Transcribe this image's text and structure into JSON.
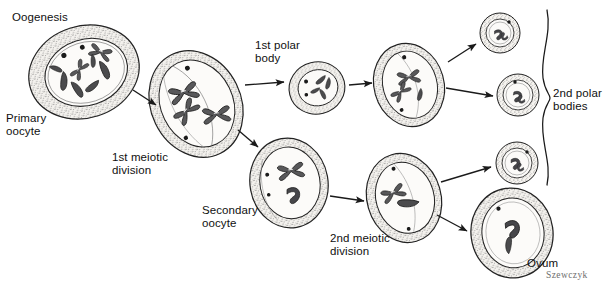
{
  "figure": {
    "title": "Oogenesis",
    "signature": "Szewczyk",
    "background_color": "#ffffff",
    "ink_color": "#1a1a1a",
    "chromatin_color": "#4a4a4a",
    "cytoplasm_color": "#f2f0ec"
  },
  "labels": [
    {
      "id": "title",
      "text": "Oogenesis",
      "x": 12,
      "y": 12
    },
    {
      "id": "primary-oocyte",
      "text": "Primary\noocyte",
      "x": 6,
      "y": 113
    },
    {
      "id": "first-meiotic",
      "text": "1st meiotic\ndivision",
      "x": 113,
      "y": 152
    },
    {
      "id": "first-polar-body",
      "text": "1st polar\nbody",
      "x": 256,
      "y": 40
    },
    {
      "id": "secondary-oocyte",
      "text": "Secondary\noocyte",
      "x": 203,
      "y": 205
    },
    {
      "id": "second-meiotic",
      "text": "2nd meiotic\ndivision",
      "x": 331,
      "y": 233
    },
    {
      "id": "second-polar",
      "text": "2nd polar\nbodies",
      "x": 554,
      "y": 88
    },
    {
      "id": "ovum",
      "text": "Ovum",
      "x": 528,
      "y": 258
    }
  ],
  "cells": [
    {
      "id": "primary-oocyte-cell",
      "name": "primary-oocyte-cell",
      "stage": "Primary oocyte",
      "cx": 84,
      "cy": 72,
      "rx": 56,
      "ry": 46,
      "rot": -18,
      "nucleus_rx": 41,
      "nucleus_ry": 32,
      "chromosome_count": 8,
      "nucleoli": 2
    },
    {
      "id": "first-meiotic-cell",
      "name": "first-meiotic-division-cell",
      "stage": "1st meiotic division",
      "cx": 196,
      "cy": 104,
      "rx": 44,
      "ry": 54,
      "rot": -26,
      "nucleus_rx": 35,
      "nucleus_ry": 44,
      "chromosome_count": 3,
      "nucleoli": 2
    },
    {
      "id": "first-polar-body-cell",
      "name": "first-polar-body-cell",
      "stage": "1st polar body",
      "cx": 317,
      "cy": 88,
      "rx": 28,
      "ry": 26,
      "rot": -14,
      "nucleus_rx": 20,
      "nucleus_ry": 18,
      "chromosome_count": 4,
      "nucleoli": 2
    },
    {
      "id": "post-polar-cell",
      "name": "post-first-polar-division-cell",
      "stage": "1st polar body dividing",
      "cx": 409,
      "cy": 85,
      "rx": 35,
      "ry": 42,
      "rot": -16,
      "nucleus_rx": 27,
      "nucleus_ry": 33,
      "chromosome_count": 3,
      "nucleoli": 2
    },
    {
      "id": "second-polar-body-upper",
      "name": "second-polar-body-upper",
      "stage": "2nd polar body",
      "cx": 500,
      "cy": 33,
      "rx": 20,
      "ry": 19,
      "rot": 0,
      "nucleus_rx": 14,
      "nucleus_ry": 13,
      "chromosome_count": 2,
      "nucleoli": 1
    },
    {
      "id": "second-polar-body-lower",
      "name": "second-polar-body-lower",
      "stage": "2nd polar body",
      "cx": 518,
      "cy": 95,
      "rx": 21,
      "ry": 20,
      "rot": 0,
      "nucleus_rx": 15,
      "nucleus_ry": 14,
      "chromosome_count": 2,
      "nucleoli": 1
    },
    {
      "id": "secondary-oocyte-cell",
      "name": "secondary-oocyte-cell",
      "stage": "Secondary oocyte",
      "cx": 289,
      "cy": 183,
      "rx": 39,
      "ry": 44,
      "rot": -10,
      "nucleus_rx": 30,
      "nucleus_ry": 35,
      "chromosome_count": 2,
      "nucleoli": 2
    },
    {
      "id": "second-meiotic-cell",
      "name": "second-meiotic-division-cell",
      "stage": "2nd meiotic division",
      "cx": 404,
      "cy": 198,
      "rx": 37,
      "ry": 44,
      "rot": -16,
      "nucleus_rx": 29,
      "nucleus_ry": 35,
      "chromosome_count": 2,
      "nucleoli": 2
    },
    {
      "id": "second-polar-body-right",
      "name": "second-polar-body-right",
      "stage": "2nd polar body",
      "cx": 517,
      "cy": 163,
      "rx": 21,
      "ry": 21,
      "rot": 0,
      "nucleus_rx": 15,
      "nucleus_ry": 15,
      "chromosome_count": 2,
      "nucleoli": 1
    },
    {
      "id": "ovum-cell",
      "name": "ovum-cell",
      "stage": "Ovum",
      "cx": 512,
      "cy": 233,
      "rx": 41,
      "ry": 45,
      "rot": -8,
      "nucleus_rx": 31,
      "nucleus_ry": 35,
      "chromosome_count": 2,
      "nucleoli": 1
    }
  ],
  "arrows": [
    {
      "id": "a1",
      "from": "primary-oocyte-cell",
      "to": "first-meiotic-cell",
      "x1": 133,
      "y1": 90,
      "x2": 158,
      "y2": 106
    },
    {
      "id": "a2",
      "from": "first-meiotic-cell",
      "to": "first-polar-body-cell",
      "x1": 245,
      "y1": 85,
      "x2": 286,
      "y2": 82
    },
    {
      "id": "a3",
      "from": "first-meiotic-cell",
      "to": "secondary-oocyte-cell",
      "x1": 238,
      "y1": 130,
      "x2": 260,
      "y2": 148
    },
    {
      "id": "a4",
      "from": "first-polar-body-cell",
      "to": "post-polar-cell",
      "x1": 349,
      "y1": 85,
      "x2": 374,
      "y2": 82
    },
    {
      "id": "a5",
      "from": "post-polar-cell",
      "to": "second-polar-body-upper",
      "x1": 448,
      "y1": 62,
      "x2": 477,
      "y2": 44
    },
    {
      "id": "a6",
      "from": "post-polar-cell",
      "to": "second-polar-body-lower",
      "x1": 446,
      "y1": 88,
      "x2": 494,
      "y2": 96
    },
    {
      "id": "a7",
      "from": "secondary-oocyte-cell",
      "to": "second-meiotic-cell",
      "x1": 330,
      "y1": 196,
      "x2": 366,
      "y2": 201
    },
    {
      "id": "a8",
      "from": "second-meiotic-cell",
      "to": "second-polar-body-right",
      "x1": 441,
      "y1": 182,
      "x2": 492,
      "y2": 166
    },
    {
      "id": "a9",
      "from": "second-meiotic-cell",
      "to": "ovum-cell",
      "x1": 437,
      "y1": 215,
      "x2": 468,
      "y2": 232
    }
  ],
  "bracket": {
    "id": "second-polar-bodies-bracket",
    "x": 548,
    "top": 10,
    "bottom": 185,
    "midpoint_y": 98
  }
}
